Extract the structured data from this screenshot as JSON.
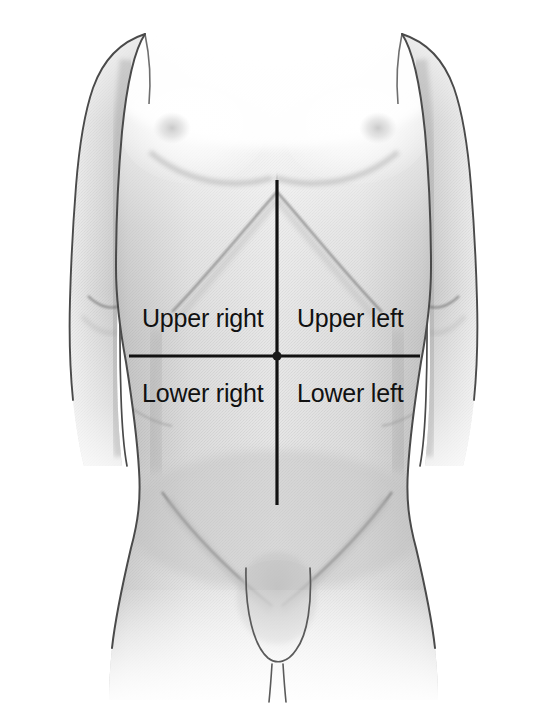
{
  "figure": {
    "background_color": "#ffffff",
    "skin_fill_color": "#cfcfcf",
    "skin_light_color": "#f2f2f2",
    "outline_color": "#3a3a3a",
    "marker_line_color": "#111111"
  },
  "quadrant_labels": {
    "upper_right": "Upper right",
    "upper_left": "Upper left",
    "lower_right": "Lower right",
    "lower_left": "Lower left"
  },
  "marker_lines": {
    "vertical": {
      "name": "median-line",
      "x": 277,
      "y_start": 180,
      "y_end": 505,
      "stroke_width": 3.2,
      "color": "#111111"
    },
    "horizontal": {
      "name": "transumbilical-line",
      "y": 356,
      "x_start": 129,
      "x_end": 420,
      "stroke_width": 3.2,
      "color": "#111111"
    },
    "intersection": {
      "name": "umbilicus",
      "x": 277,
      "y": 356
    }
  },
  "anatomy_features": [
    "shoulders",
    "chest",
    "nipples",
    "costal-margin",
    "linea-alba",
    "abdomen",
    "iliac-crest",
    "inguinal-creases",
    "genitalia",
    "upper-arms",
    "elbow-creases"
  ]
}
